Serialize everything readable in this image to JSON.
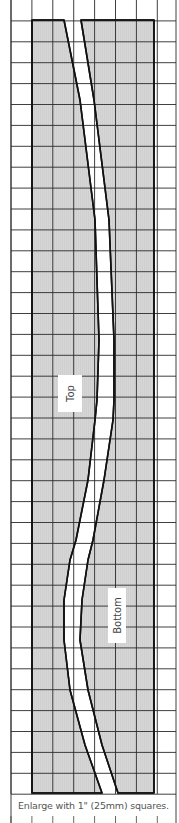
{
  "diagram": {
    "type": "sewing-pattern-grid",
    "grid": {
      "cell_size_px": 20.9,
      "columns": 8,
      "rows": 38,
      "line_color": "#222222",
      "background": "#ffffff"
    },
    "pieces": [
      {
        "name": "left-piece",
        "fill": "#d4d4d4",
        "outline": "#111111"
      },
      {
        "name": "right-piece",
        "fill": "#d4d4d4",
        "outline": "#111111"
      }
    ],
    "labels": {
      "top": "Top",
      "bottom": "Bottom"
    },
    "caption": "Enlarge with 1\" (25mm) squares."
  }
}
